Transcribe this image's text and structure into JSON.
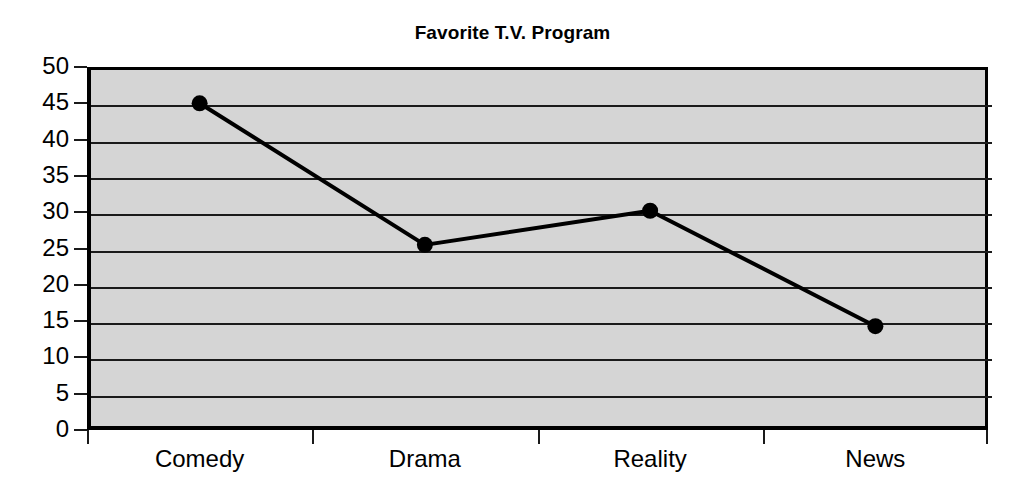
{
  "chart_data": {
    "type": "line",
    "title": "Favorite T.V. Program",
    "xlabel": "",
    "ylabel": "",
    "categories": [
      "Comedy",
      "Drama",
      "Reality",
      "News"
    ],
    "values": [
      45,
      25.5,
      30.2,
      14.3
    ],
    "series": [
      {
        "name": "Favorite T.V. Program",
        "values": [
          45,
          25.5,
          30.2,
          14.3
        ]
      }
    ],
    "ylim": [
      0,
      50
    ],
    "y_ticks": [
      0,
      5,
      10,
      15,
      20,
      25,
      30,
      35,
      40,
      45,
      50
    ],
    "y_tick_labels": [
      "0",
      "5",
      "10",
      "15",
      "20",
      "25",
      "30",
      "35",
      "40",
      "45",
      "50"
    ],
    "grid": true,
    "grid_axis": "y",
    "legend": false,
    "legend_position": "none",
    "marker": "circle",
    "colors": {
      "line": "#000000",
      "marker": "#000000",
      "plot_background": "#d5d5d5",
      "axis": "#000000",
      "gridline": "#1a1a1a",
      "figure_background": "#ffffff",
      "text": "#000000"
    }
  }
}
